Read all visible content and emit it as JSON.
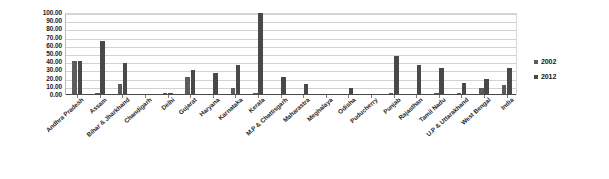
{
  "chart_data": {
    "type": "bar",
    "title": "",
    "subtitle": "",
    "xlabel": "",
    "ylabel": "",
    "ylim": [
      0,
      100
    ],
    "grid": true,
    "legend_position": "right",
    "y_tick_labels": [
      "100.00",
      "90.00",
      "80.00",
      "70.00",
      "60.00",
      "50.00",
      "40.00",
      "30.00",
      "20.00",
      "10.00",
      "0.00"
    ],
    "categories": [
      "Andhra Pradesh",
      "Assam",
      "Bihar & Jharkhand",
      "Chandigarh",
      "Delhi",
      "Gujarat",
      "Haryana",
      "Karnataka",
      "Kerala",
      "M.P & Chattisgarh",
      "Maharastra",
      "Meghalaya",
      "Odisha",
      "Puducherry",
      "Punjab",
      "Rajasthan",
      "Tamil Nadu",
      "U.P & Uttarakhand",
      "West Bengal",
      "India"
    ],
    "series": [
      {
        "name": "2002",
        "color": "#5c5c5c",
        "values": [
          41.0,
          3.0,
          14.0,
          0.0,
          2.0,
          22.0,
          0.0,
          8.0,
          3.0,
          0.0,
          0.0,
          0.0,
          0.0,
          0.0,
          2.0,
          0.0,
          2.0,
          2.0,
          8.0,
          12.0
        ]
      },
      {
        "name": "2012",
        "color": "#494949",
        "values": [
          41.0,
          66.0,
          39.0,
          0.0,
          2.0,
          31.0,
          27.0,
          37.0,
          100.0,
          22.0,
          13.0,
          0.0,
          8.0,
          0.0,
          47.0,
          36.0,
          33.0,
          15.0,
          20.0,
          33.0
        ]
      }
    ]
  },
  "legend": {
    "items": [
      {
        "label": "2002"
      },
      {
        "label": "2012"
      }
    ]
  }
}
